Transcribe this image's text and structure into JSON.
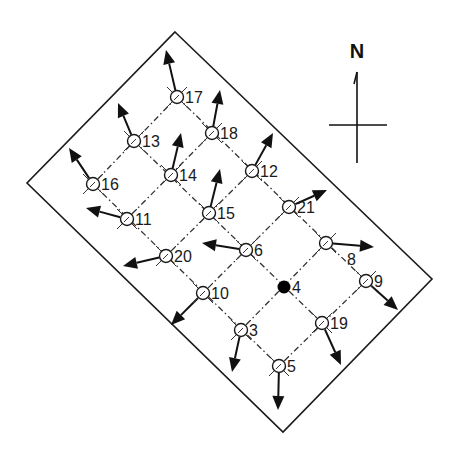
{
  "diagram": {
    "type": "station-grid-vector-map",
    "compass": {
      "label": "N",
      "x": 357,
      "top": 72,
      "bottom": 163,
      "cross_y": 125,
      "cross_left": 329,
      "cross_right": 387
    },
    "boundary": {
      "points": [
        [
          175,
          32
        ],
        [
          432,
          279
        ],
        [
          283,
          432
        ],
        [
          27,
          183
        ]
      ]
    },
    "colors": {
      "line": "#1a1a1a",
      "grid": "#333333",
      "arrow": "#111111",
      "background": "#ffffff"
    },
    "grid_lines": [
      [
        [
          177,
          97
        ],
        [
          93,
          184
        ]
      ],
      [
        [
          212,
          133
        ],
        [
          127,
          219
        ]
      ],
      [
        [
          252,
          171
        ],
        [
          166,
          256
        ]
      ],
      [
        [
          289,
          207
        ],
        [
          203,
          293
        ]
      ],
      [
        [
          326,
          243
        ],
        [
          241,
          330
        ]
      ],
      [
        [
          366,
          281
        ],
        [
          279,
          366
        ]
      ],
      [
        [
          177,
          97
        ],
        [
          366,
          281
        ]
      ],
      [
        [
          134,
          141
        ],
        [
          322,
          323
        ]
      ],
      [
        [
          93,
          184
        ],
        [
          279,
          366
        ]
      ]
    ],
    "nodes": [
      {
        "id": "17",
        "x": 177,
        "y": 97,
        "filled": false,
        "arrow": [
          166,
          50
        ]
      },
      {
        "id": "13",
        "x": 134,
        "y": 141,
        "filled": false,
        "arrow": [
          118,
          103
        ]
      },
      {
        "id": "16",
        "x": 93,
        "y": 184,
        "filled": false,
        "arrow": [
          69,
          148
        ]
      },
      {
        "id": "18",
        "x": 212,
        "y": 133,
        "filled": false,
        "arrow": [
          220,
          90
        ]
      },
      {
        "id": "14",
        "x": 171,
        "y": 175,
        "filled": false,
        "arrow": [
          181,
          133
        ]
      },
      {
        "id": "11",
        "x": 127,
        "y": 219,
        "filled": false,
        "arrow": [
          86,
          208
        ]
      },
      {
        "id": "12",
        "x": 252,
        "y": 171,
        "filled": false,
        "arrow": [
          273,
          133
        ]
      },
      {
        "id": "15",
        "x": 209,
        "y": 213,
        "filled": false,
        "arrow": [
          220,
          169
        ]
      },
      {
        "id": "20",
        "x": 166,
        "y": 256,
        "filled": false,
        "arrow": [
          123,
          266
        ]
      },
      {
        "id": "21",
        "x": 289,
        "y": 207,
        "filled": false,
        "arrow": [
          327,
          190
        ]
      },
      {
        "id": "6",
        "x": 246,
        "y": 250,
        "filled": false,
        "arrow": [
          202,
          243
        ]
      },
      {
        "id": "10",
        "x": 203,
        "y": 293,
        "filled": false,
        "arrow": [
          171,
          325
        ]
      },
      {
        "id": "8",
        "x": 326,
        "y": 243,
        "filled": false,
        "arrow": [
          374,
          247
        ]
      },
      {
        "id": "4",
        "x": 284,
        "y": 287,
        "filled": true,
        "arrow": null
      },
      {
        "id": "3",
        "x": 241,
        "y": 330,
        "filled": false,
        "arrow": [
          232,
          372
        ]
      },
      {
        "id": "9",
        "x": 366,
        "y": 281,
        "filled": false,
        "arrow": [
          398,
          310
        ]
      },
      {
        "id": "19",
        "x": 322,
        "y": 323,
        "filled": false,
        "arrow": [
          341,
          365
        ]
      },
      {
        "id": "5",
        "x": 279,
        "y": 366,
        "filled": false,
        "arrow": [
          278,
          410
        ]
      }
    ]
  }
}
